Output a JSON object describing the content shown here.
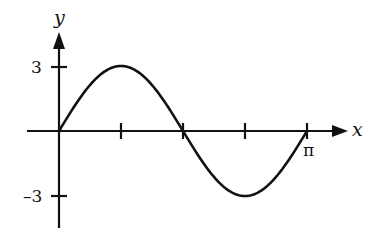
{
  "chart_data": {
    "type": "line",
    "title": "",
    "function": "y = 3 sin(2x)",
    "xlabel": "x",
    "ylabel": "y",
    "xlim": [
      0,
      3.14159
    ],
    "ylim": [
      -3,
      3
    ],
    "grid": false,
    "legend": null,
    "x_tick_positions": [
      0.7854,
      1.5708,
      2.3562,
      3.14159
    ],
    "x_tick_labels": [
      "",
      "",
      "",
      "π"
    ],
    "y_tick_positions": [
      3,
      -3
    ],
    "y_tick_labels": [
      "3",
      "–3"
    ],
    "series": [
      {
        "name": "y",
        "x": [
          0,
          0.3927,
          0.7854,
          1.1781,
          1.5708,
          1.9635,
          2.3562,
          2.7489,
          3.14159
        ],
        "values": [
          0,
          2.12,
          3,
          2.12,
          0,
          -2.12,
          -3,
          -2.12,
          0
        ]
      }
    ],
    "annotations": []
  },
  "labels": {
    "x_axis": "x",
    "y_axis": "y",
    "y_tick_pos": "3",
    "y_tick_neg": "–3",
    "x_tick_end": "π"
  },
  "colors": {
    "stroke": "#111111",
    "background": "#ffffff"
  }
}
